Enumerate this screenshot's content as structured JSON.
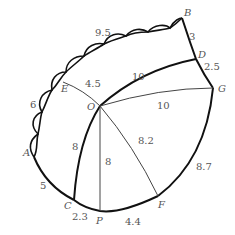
{
  "diagram": {
    "type": "pattern-template",
    "points": {
      "A": {
        "label": "A",
        "x": 34,
        "y": 157
      },
      "B": {
        "label": "B",
        "x": 182,
        "y": 18
      },
      "C": {
        "label": "C",
        "x": 74,
        "y": 200
      },
      "D": {
        "label": "D",
        "x": 196,
        "y": 59
      },
      "E": {
        "label": "E",
        "x": 63,
        "y": 82
      },
      "F": {
        "label": "F",
        "x": 158,
        "y": 196
      },
      "G": {
        "label": "G",
        "x": 213,
        "y": 88
      },
      "O": {
        "label": "O",
        "x": 100,
        "y": 106
      },
      "P": {
        "label": "P",
        "x": 100,
        "y": 211
      }
    },
    "measurements": {
      "top_arc": "9.5",
      "BD": "3",
      "DG": "2.5",
      "OD": "10",
      "OG": "10",
      "EO": "4.5",
      "left_arc": "6",
      "AC": "5",
      "OC": "8",
      "OP": "8",
      "OF": "8.2",
      "GF": "8.7",
      "CP": "2.3",
      "PF": "4.4"
    },
    "colors": {
      "thick_line": "#111111",
      "thin_line": "#444444",
      "label": "#555555"
    }
  }
}
